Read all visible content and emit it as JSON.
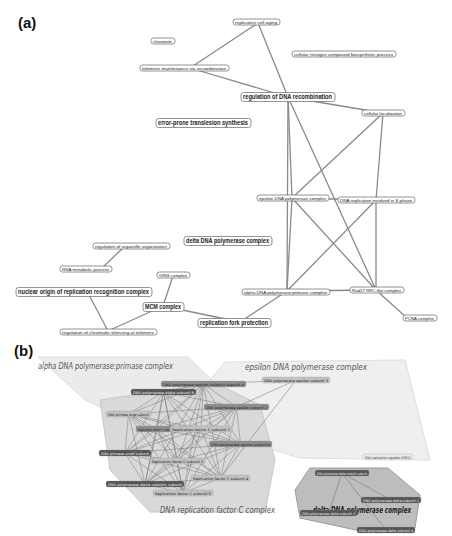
{
  "figure": {
    "panel_a_label": "(a)",
    "panel_b_label": "(b)"
  },
  "panel_a": {
    "nodes": [
      {
        "id": "rca",
        "label": "replicative cell aging",
        "size": "small"
      },
      {
        "id": "chr",
        "label": "chromatin",
        "size": "small"
      },
      {
        "id": "cnc",
        "label": "cellular nitrogen compound biosynthetic process",
        "size": "small"
      },
      {
        "id": "tmr",
        "label": "telomere maintenance via recombination",
        "size": "small"
      },
      {
        "id": "rdr",
        "label": "regulation of DNA recombination",
        "size": "large"
      },
      {
        "id": "cl",
        "label": "cellular localization",
        "size": "small"
      },
      {
        "id": "epts",
        "label": "error-prone translesion synthesis",
        "size": "large"
      },
      {
        "id": "edpc",
        "label": "epsilon DNA polymerase complex",
        "size": "small"
      },
      {
        "id": "drs",
        "label": "DNA replication involved in S phase",
        "size": "small"
      },
      {
        "id": "ddpc",
        "label": "delta DNA polymerase complex",
        "size": "large"
      },
      {
        "id": "roo",
        "label": "regulation of organelle organization",
        "size": "small"
      },
      {
        "id": "rmp",
        "label": "RNA metabolic process",
        "size": "small"
      },
      {
        "id": "gins",
        "label": "GINS complex",
        "size": "small"
      },
      {
        "id": "norc",
        "label": "nuclear origin of replication recognition complex",
        "size": "large"
      },
      {
        "id": "adpp",
        "label": "alpha DNA polymerase:primase complex",
        "size": "small"
      },
      {
        "id": "rad17",
        "label": "Rad17 RFC-like complex",
        "size": "small"
      },
      {
        "id": "mcm",
        "label": "MCM complex",
        "size": "large"
      },
      {
        "id": "pcna",
        "label": "PCNA complex",
        "size": "small"
      },
      {
        "id": "rfp",
        "label": "replication fork protection",
        "size": "large"
      },
      {
        "id": "rcst",
        "label": "regulation of chromatin silencing at telomere",
        "size": "small"
      }
    ],
    "edges": [
      [
        "rca",
        "tmr"
      ],
      [
        "rca",
        "rdr"
      ],
      [
        "tmr",
        "rdr"
      ],
      [
        "rdr",
        "cl"
      ],
      [
        "rdr",
        "edpc"
      ],
      [
        "rdr",
        "rad17"
      ],
      [
        "rdr",
        "adpp"
      ],
      [
        "cl",
        "edpc"
      ],
      [
        "cl",
        "drs"
      ],
      [
        "edpc",
        "drs"
      ],
      [
        "edpc",
        "adpp"
      ],
      [
        "edpc",
        "rad17"
      ],
      [
        "drs",
        "adpp"
      ],
      [
        "drs",
        "rad17"
      ],
      [
        "adpp",
        "rad17"
      ],
      [
        "adpp",
        "rfp"
      ],
      [
        "rad17",
        "pcna"
      ],
      [
        "roo",
        "rmp"
      ],
      [
        "gins",
        "mcm"
      ],
      [
        "norc",
        "rcst"
      ],
      [
        "mcm",
        "rcst"
      ],
      [
        "mcm",
        "rfp"
      ]
    ]
  },
  "panel_b": {
    "groups": [
      {
        "id": "alpha",
        "label": "alpha DNA polymerase:primase complex"
      },
      {
        "id": "epsilon",
        "label": "epsilon DNA polymerase complex"
      },
      {
        "id": "rfc",
        "label": "DNA replication factor C complex"
      },
      {
        "id": "delta",
        "label": "delta DNA polymerase complex"
      }
    ],
    "nodes": [
      {
        "id": "epscat",
        "label": "DNA polymerase epsilon catalytic subunit A",
        "tone": "mid"
      },
      {
        "id": "eps3",
        "label": "DNA polymerase epsilon subunit 3",
        "tone": "light"
      },
      {
        "id": "alpha1",
        "label": "DNA polymerase alpha subunit B",
        "tone": "dark"
      },
      {
        "id": "eps2",
        "label": "DNA polymerase epsilon subunit 2",
        "tone": "mid"
      },
      {
        "id": "prim",
        "label": "DNA primase large subunit",
        "tone": "light"
      },
      {
        "id": "rfc1",
        "label": "Replication factor C subunit 1",
        "tone": "mid"
      },
      {
        "id": "rfc2",
        "label": "Replication factor C subunit 2",
        "tone": "light"
      },
      {
        "id": "eps4",
        "label": "DNA polymerase epsilon subunit 4",
        "tone": "mid"
      },
      {
        "id": "primsm",
        "label": "DNA primase small subunit",
        "tone": "dark"
      },
      {
        "id": "rfc3",
        "label": "Replication factor C subunit 3",
        "tone": "light"
      },
      {
        "id": "rfc4",
        "label": "Replication factor C subunit 4",
        "tone": "light"
      },
      {
        "id": "alphacat",
        "label": "DNA polymerase alpha catalytic subunit",
        "tone": "dark"
      },
      {
        "id": "rfc5",
        "label": "Replication factor C subunit 5",
        "tone": "light"
      },
      {
        "id": "dpb11",
        "label": "DNA replication regulator DPB11",
        "tone": "white"
      },
      {
        "id": "delcat",
        "label": "DNA polymerase delta catalytic subunit",
        "tone": "dark"
      },
      {
        "id": "del2",
        "label": "DNA polymerase delta subunit 2",
        "tone": "dark"
      },
      {
        "id": "del3",
        "label": "DNA polymerase delta subunit 3",
        "tone": "dark"
      },
      {
        "id": "del4",
        "label": "DNA polymerase delta subunit 4",
        "tone": "dark"
      }
    ],
    "edges": [
      [
        "eps3",
        "epscat"
      ],
      [
        "eps3",
        "eps2"
      ],
      [
        "eps3",
        "rfc4"
      ],
      [
        "delcat",
        "del2"
      ],
      [
        "delcat",
        "del3"
      ],
      [
        "delcat",
        "del4"
      ]
    ],
    "dense_cluster": [
      "epscat",
      "alpha1",
      "eps2",
      "prim",
      "rfc1",
      "rfc2",
      "eps4",
      "primsm",
      "rfc3",
      "rfc4",
      "alphacat",
      "rfc5"
    ]
  }
}
